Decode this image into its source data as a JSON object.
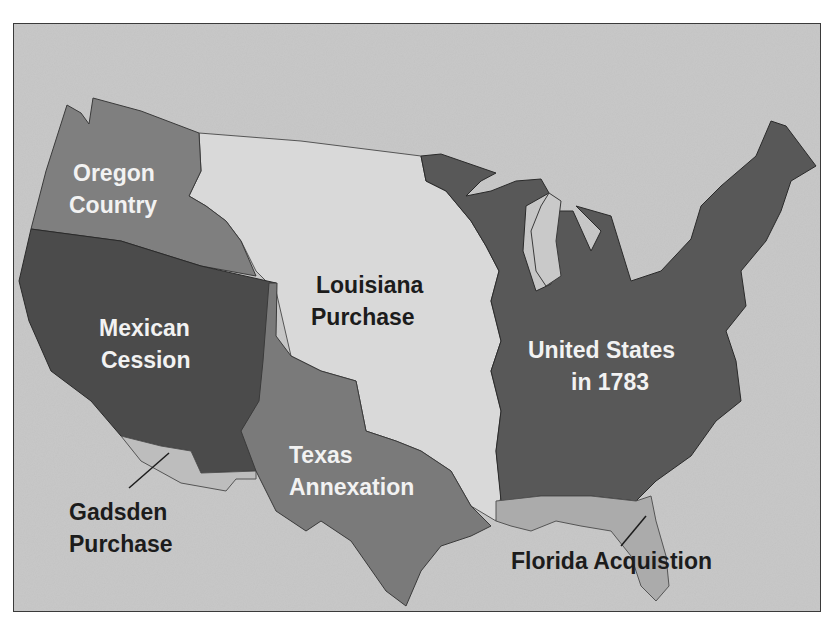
{
  "map": {
    "title": "",
    "colors": {
      "background": "#c9c9c9",
      "oregon_country": "#7f7f7f",
      "mexican_cession": "#4b4b4b",
      "louisiana_purchase": "#d9d9d9",
      "texas_annexation": "#7a7a7a",
      "united_states_1783": "#585858",
      "gadsden_purchase": "#bdbdbd",
      "florida_acquisition": "#ababab"
    },
    "regions": [
      {
        "id": "oregon",
        "line1": "Oregon",
        "line2": "Country"
      },
      {
        "id": "mexican",
        "line1": "Mexican",
        "line2": "Cession"
      },
      {
        "id": "louisiana",
        "line1": "Louisiana",
        "line2": "Purchase"
      },
      {
        "id": "us1783",
        "line1": "United States",
        "line2": "in 1783"
      },
      {
        "id": "texas",
        "line1": "Texas",
        "line2": "Annexation"
      },
      {
        "id": "gadsden",
        "line1": "Gadsden",
        "line2": "Purchase"
      },
      {
        "id": "florida",
        "line1": "Florida Acquistion"
      }
    ]
  }
}
